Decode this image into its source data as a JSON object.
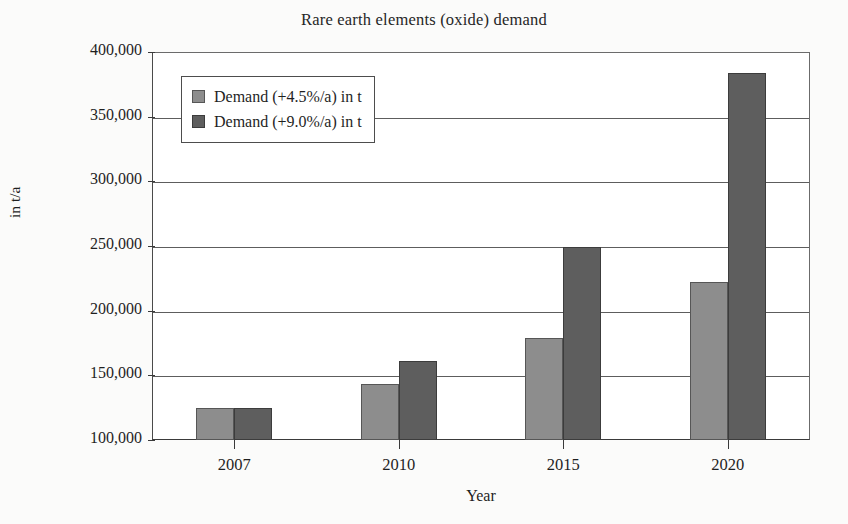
{
  "chart_data": {
    "type": "bar",
    "title": "Rare earth elements (oxide) demand",
    "xlabel": "Year",
    "ylabel": "in t/a",
    "categories": [
      "2007",
      "2010",
      "2015",
      "2020"
    ],
    "series": [
      {
        "name": "Demand (+4.5%/a) in t",
        "color": "#8d8d8d",
        "values": [
          125000,
          143000,
          179000,
          222000
        ]
      },
      {
        "name": "Demand (+9.0%/a) in t",
        "color": "#5e5e5e",
        "values": [
          125000,
          161000,
          249000,
          384000
        ]
      }
    ],
    "ylim": [
      100000,
      400000
    ],
    "yticks": [
      100000,
      150000,
      200000,
      250000,
      300000,
      350000,
      400000
    ],
    "ytick_labels": [
      "100,000",
      "150,000",
      "200,000",
      "250,000",
      "300,000",
      "350,000",
      "400,000"
    ],
    "grid": true,
    "legend_position": "upper left"
  }
}
